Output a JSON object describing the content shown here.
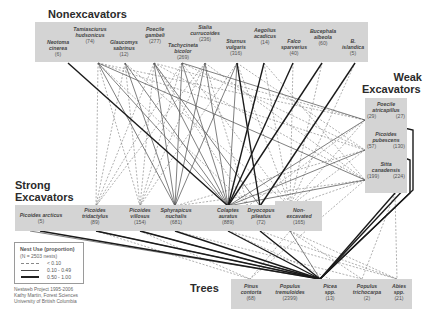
{
  "groups": {
    "nonexcavators": {
      "title": "Nonexcavators",
      "nodes": [
        {
          "id": "neotoma",
          "name": "Neotoma cinerea",
          "name1": "Neotoma",
          "name2": "cinerea",
          "count": "(6)"
        },
        {
          "id": "tamiasciurus",
          "name": "Tamiasciurus hudsonicus",
          "name1": "Tamiasciurus",
          "name2": "hudsonicus",
          "count": "(74)"
        },
        {
          "id": "glaucomys",
          "name": "Glaucomys sabrinus",
          "name1": "Glaucomys",
          "name2": "sabrinus",
          "count": "(12)"
        },
        {
          "id": "poecile_gambeli",
          "name": "Poecile gambeli",
          "name1": "Poecile",
          "name2": "gambeli",
          "count": "(277)"
        },
        {
          "id": "tachycineta",
          "name": "Tachycineta bicolor",
          "name1": "Tachycineta",
          "name2": "bicolor",
          "count": "(269)"
        },
        {
          "id": "sialia",
          "name": "Sialia currucoides",
          "name1": "Sialia",
          "name2": "currucoides",
          "count": "(236)"
        },
        {
          "id": "sturnus",
          "name": "Sturnus vulgaris",
          "name1": "Sturnus",
          "name2": "vulgaris",
          "count": "(316)"
        },
        {
          "id": "aegolius",
          "name": "Aegolius acadicus",
          "name1": "Aegolius",
          "name2": "acadicus",
          "count": "(14)"
        },
        {
          "id": "falco",
          "name": "Falco sparverius",
          "name1": "Falco",
          "name2": "sparverius",
          "count": "(40)"
        },
        {
          "id": "bucephala_albeola",
          "name": "Bucephala albeola",
          "name1": "Bucephala",
          "name2": "albeola",
          "count": "(60)"
        },
        {
          "id": "b_islandica",
          "name": "B. islandica",
          "name1": "B.",
          "name2": "islandica",
          "count": "(5)"
        }
      ]
    },
    "weak_excavators": {
      "title_line1": "Weak",
      "title_line2": "Excavators",
      "nodes": [
        {
          "id": "poecile_atricapillus",
          "name1": "Poecile",
          "name2": "atricapillus",
          "count_left": "(29)",
          "count_right": "(27)"
        },
        {
          "id": "picoides_pubescens",
          "name1": "Picoides",
          "name2": "pubescens",
          "count_left": "(57)",
          "count_right": "(130)"
        },
        {
          "id": "sitta",
          "name1": "Sitta",
          "name2": "canadensis",
          "count_left": "(199)",
          "count_right": "(224)"
        }
      ]
    },
    "strong_excavators": {
      "title_line1": "Strong",
      "title_line2": "Excavators",
      "nodes": [
        {
          "id": "picoides_arcticus",
          "name1": "Picoides arcticus",
          "name2": "",
          "count": "(5)"
        },
        {
          "id": "picoides_tridactylus",
          "name1": "Picoides",
          "name2": "tridactylus",
          "count": "(89)"
        },
        {
          "id": "picoides_villosus",
          "name1": "Picoides",
          "name2": "villosus",
          "count": "(154)"
        },
        {
          "id": "sphyrapicus",
          "name1": "Sphyrapicus",
          "name2": "nuchalis",
          "count": "(681)"
        },
        {
          "id": "colaptes",
          "name1": "Colaptes",
          "name2": "auratus",
          "count": "(889)"
        },
        {
          "id": "dryocopus",
          "name1": "Dryocopus",
          "name2": "pileatus",
          "count": "(72)"
        },
        {
          "id": "non_excavated",
          "name1": "Non-",
          "name2": "excavated",
          "count": "(165)"
        }
      ]
    },
    "trees": {
      "title": "Trees",
      "nodes": [
        {
          "id": "pinus",
          "name1": "Pinus",
          "name2": "contorta",
          "count": "(68)"
        },
        {
          "id": "populus_tremuloides",
          "name1": "Populus",
          "name2": "tremuloides",
          "count": "(2399)"
        },
        {
          "id": "picea",
          "name1": "Picea",
          "name2": "spp.",
          "count": "(13)"
        },
        {
          "id": "populus_trichocarpa",
          "name1": "Populus",
          "name2": "trichocarpa",
          "count": "(2)"
        },
        {
          "id": "abies",
          "name1": "Abies",
          "name2": "spp.",
          "count": "(21)"
        }
      ]
    }
  },
  "legend": {
    "title": "Nest Use (proportion)",
    "subtitle": "(N = 2503 nests)",
    "items": [
      {
        "style": "dashed",
        "label": "< 0.10"
      },
      {
        "style": "thin",
        "label": "0.10 - 0.49"
      },
      {
        "style": "thick",
        "label": "0.50 - 1.00"
      }
    ]
  },
  "credit": {
    "line1": "Nestweb Project 1995-2006",
    "line2": "Kathy Martin, Forest Sciences",
    "line3": "University of British Columbia"
  },
  "colors": {
    "box_fill": "#d4d4d4",
    "line": "#222222",
    "dashed_line": "#777777",
    "title": "#2b2b2b"
  }
}
